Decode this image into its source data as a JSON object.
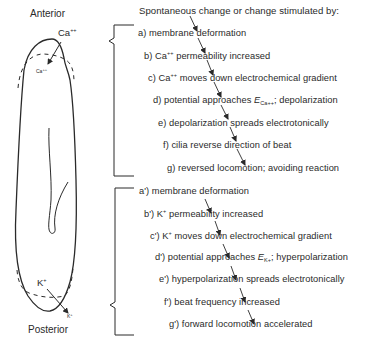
{
  "figure": {
    "labels": {
      "anterior": "Anterior",
      "posterior": "Posterior",
      "ca_outside": "Ca",
      "ca_outside_sup": "++",
      "ca_inside": "Ca",
      "ca_inside_sup": "++",
      "k_inside": "K",
      "k_inside_sup": "+",
      "k_outside": "K",
      "k_outside_sup": "+"
    },
    "heading": "Spontaneous change or change stimulated by:",
    "anterior_cascade": [
      {
        "prefix": "a)",
        "text": "membrane deformation"
      },
      {
        "prefix": "b)",
        "pre": "Ca",
        "sup": "++",
        "text": "permeability increased"
      },
      {
        "prefix": "c)",
        "pre": "Ca",
        "sup": "++",
        "text": "moves down electrochemical gradient"
      },
      {
        "prefix": "d)",
        "text_a": "potential approaches",
        "E": "E",
        "sub": "Ca++",
        "text_b": "; depolarization"
      },
      {
        "prefix": "e)",
        "text": "depolarization spreads electrotonically"
      },
      {
        "prefix": "f)",
        "text": "cilia reverse direction of beat"
      },
      {
        "prefix": "g)",
        "text": "reversed locomotion; avoiding reaction"
      }
    ],
    "posterior_cascade": [
      {
        "prefix": "a')",
        "text": "membrane deformation"
      },
      {
        "prefix": "b')",
        "pre": "K",
        "sup": "+",
        "text": "permeability increased"
      },
      {
        "prefix": "c')",
        "pre": "K",
        "sup": "+",
        "text": "moves down electrochemical gradient"
      },
      {
        "prefix": "d')",
        "text_a": "potential approaches",
        "E": "E",
        "sub": "K+",
        "text_b": "; hyperpolarization"
      },
      {
        "prefix": "e')",
        "text": "hyperpolarization spreads electrotonically"
      },
      {
        "prefix": "f')",
        "text": "beat frequency increased"
      },
      {
        "prefix": "g')",
        "text": "forward locomotion accelerated"
      }
    ],
    "colors": {
      "ink": "#2a2a2a",
      "background": "#ffffff"
    }
  }
}
